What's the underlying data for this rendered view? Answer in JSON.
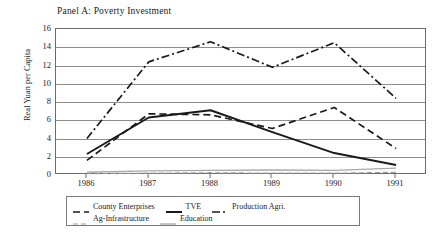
{
  "chart_data": {
    "type": "line",
    "title": "Panel A: Poverty Investment",
    "xlabel": "",
    "ylabel": "Real Yuan per Capita",
    "x": [
      "1986",
      "1987",
      "1988",
      "1989",
      "1990",
      "1991"
    ],
    "ylim": [
      0,
      16
    ],
    "ytick_step": 2,
    "yticks": [
      "16",
      "14",
      "12",
      "10",
      "8",
      "6",
      "4",
      "2",
      "0"
    ],
    "grid": true,
    "legend_position": "below-plot",
    "series": [
      {
        "name": "County Enterprises",
        "style": "dashed",
        "color": "#1a1a1a",
        "values": [
          1.6,
          6.7,
          6.6,
          5.1,
          7.4,
          2.9
        ]
      },
      {
        "name": "TVE",
        "style": "solid-thick",
        "color": "#1a1a1a",
        "values": [
          2.3,
          6.3,
          7.1,
          4.7,
          2.4,
          1.1
        ]
      },
      {
        "name": "Production Agri.",
        "style": "dash-dot",
        "color": "#1a1a1a",
        "values": [
          4.0,
          12.4,
          14.6,
          11.8,
          14.5,
          8.4
        ]
      },
      {
        "name": "Ag-Infrastructure",
        "style": "dashed-light",
        "color": "#9a9a9a",
        "values": [
          0.15,
          0.2,
          0.25,
          0.2,
          0.2,
          0.3
        ]
      },
      {
        "name": "Education",
        "style": "solid-light",
        "color": "#a8a8a8",
        "values": [
          0.3,
          0.45,
          0.5,
          0.55,
          0.5,
          0.75
        ]
      }
    ]
  }
}
